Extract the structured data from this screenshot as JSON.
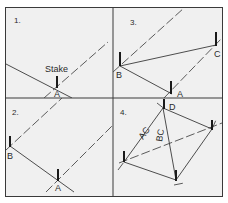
{
  "diagram": {
    "colors": {
      "background": "#f0f0f0",
      "frame": "#3a3a3a",
      "line": "#3a3a3a",
      "stake": "#1a1a1a"
    },
    "panels": [
      {
        "number": "1.",
        "labels": {
          "stake": "Stake",
          "a": "A"
        }
      },
      {
        "number": "3.",
        "labels": {
          "a": "A",
          "b": "B",
          "c": "C"
        }
      },
      {
        "number": "2.",
        "labels": {
          "a": "A",
          "b": "B"
        }
      },
      {
        "number": "4.",
        "labels": {
          "d": "D",
          "ac": "AC",
          "bc": "BC"
        }
      }
    ]
  }
}
